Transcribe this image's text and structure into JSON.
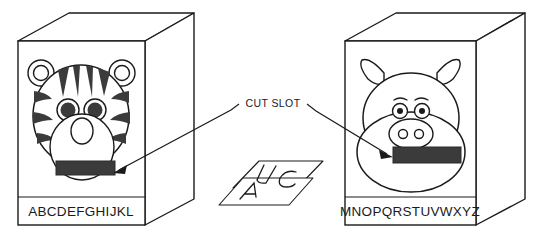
{
  "figure": {
    "type": "instructional-line-drawing",
    "background_color": "#ffffff",
    "line_color": "#1a1a1a",
    "slot_fill_color": "#3b3b3b",
    "stripe_fill_color": "#3b3b3b"
  },
  "annotation": {
    "label": "CUT SLOT",
    "arrow_count": 2,
    "arrow_targets": [
      "tiger-cut-slot",
      "pig-cut-slot"
    ]
  },
  "boxes": [
    {
      "id": "left-box",
      "character": "tiger",
      "alphabet_label": "ABCDEFGHIJKL",
      "slot_name": "cut-slot",
      "features": {
        "ears": 2,
        "eyes": 2,
        "stripes": 10,
        "muzzle": 1,
        "nose": 1
      }
    },
    {
      "id": "right-box",
      "character": "pig",
      "alphabet_label": "MNOPQRSTUVWXYZ",
      "slot_name": "cut-slot",
      "features": {
        "ears": 2,
        "eyes": 2,
        "eyebrows": 2,
        "snout": 1,
        "nostrils": 2
      }
    }
  ],
  "cards": {
    "name": "letter-cards",
    "count": 3,
    "letters": [
      "U",
      "C",
      "A"
    ]
  }
}
